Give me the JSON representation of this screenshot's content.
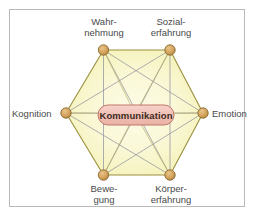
{
  "figure": {
    "type": "hexagon-network-diagram",
    "center_label": "Kommunikation",
    "frame": {
      "border_color": "#b9b9b9",
      "background": "#ffffff"
    },
    "palette": {
      "hexagon_fill": "#f7f5c0",
      "hexagon_fill_light": "#fdfce7",
      "hexagon_edge": "#9a8f3e",
      "diagonal_line": "#8d8f9c",
      "node_fill": "#d8a960",
      "node_edge": "#8a6b33",
      "center_pill_fill": "#f2c2b8",
      "center_pill_edge": "#c2766a",
      "label_text": "#4a4a4a",
      "center_text": "#3b2b22"
    }
  },
  "nodes": [
    {
      "id": "wahrnehmung",
      "label_line1": "Wahr-",
      "label_line2": "nehmung",
      "position": "top-left"
    },
    {
      "id": "sozialerfahrung",
      "label_line1": "Sozial-",
      "label_line2": "erfahrung",
      "position": "top-right"
    },
    {
      "id": "emotion",
      "label_line1": "Emotion",
      "label_line2": "",
      "position": "right"
    },
    {
      "id": "koerpererfahrung",
      "label_line1": "Körper-",
      "label_line2": "erfahrung",
      "position": "bottom-right"
    },
    {
      "id": "bewegung",
      "label_line1": "Bewe-",
      "label_line2": "gung",
      "position": "bottom-left"
    },
    {
      "id": "kognition",
      "label_line1": "Kognition",
      "label_line2": "",
      "position": "left"
    }
  ]
}
